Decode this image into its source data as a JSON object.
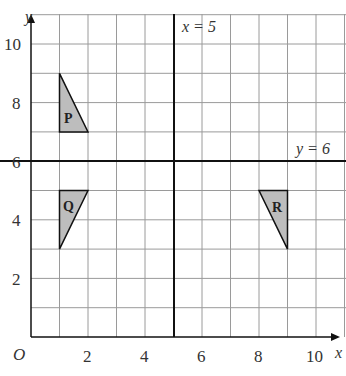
{
  "axes": {
    "x_label": "x",
    "y_label": "y",
    "origin_label": "O",
    "x_ticks": [
      "2",
      "4",
      "6",
      "8",
      "10"
    ],
    "y_ticks": [
      "2",
      "4",
      "6",
      "8",
      "10"
    ]
  },
  "lines": {
    "vertical": "x = 5",
    "horizontal": "y = 6"
  },
  "shapes": {
    "P": {
      "label": "P",
      "vertices": [
        [
          1,
          9
        ],
        [
          1,
          7
        ],
        [
          2,
          7
        ]
      ]
    },
    "Q": {
      "label": "Q",
      "vertices": [
        [
          1,
          5
        ],
        [
          2,
          5
        ],
        [
          1,
          3
        ]
      ]
    },
    "R": {
      "label": "R",
      "vertices": [
        [
          8,
          5
        ],
        [
          9,
          5
        ],
        [
          9,
          3
        ]
      ]
    }
  },
  "colors": {
    "fill": "#bdbdbd",
    "grid": "#9a9a9a",
    "line": "#111111"
  }
}
